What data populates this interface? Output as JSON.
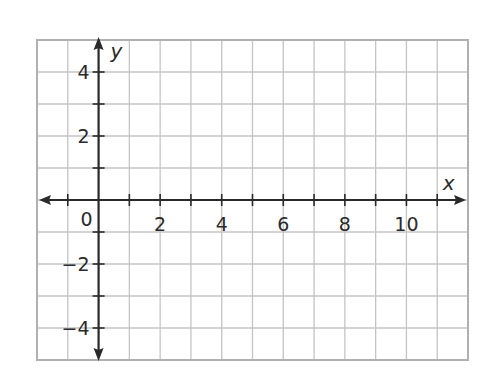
{
  "chart_data": {
    "type": "scatter",
    "title": "",
    "xlabel": "x",
    "ylabel": "y",
    "xlim": [
      -2,
      12
    ],
    "ylim": [
      -5,
      5
    ],
    "grid": true,
    "grid_step": 1,
    "x_ticks": [
      2,
      4,
      6,
      8,
      10
    ],
    "x_tick_labels": [
      "2",
      "4",
      "6",
      "8",
      "10"
    ],
    "y_ticks": [
      4,
      2,
      -2,
      -4
    ],
    "y_tick_labels": [
      "4",
      "2",
      "−2",
      "−4"
    ],
    "origin_label": "0",
    "series": [],
    "legend": null
  },
  "colors": {
    "grid": "#c4c4c4",
    "border": "#b0b0b0",
    "axis": "#2a2a2a",
    "text": "#2a2a2a"
  }
}
